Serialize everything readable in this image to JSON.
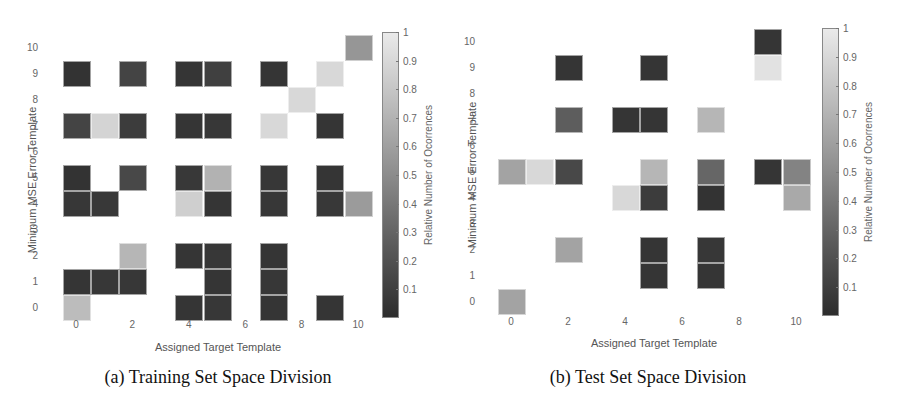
{
  "figure": {
    "captions": [
      "(a) Training Set Space Division",
      "(b) Test Set Space Division"
    ]
  },
  "colors": {
    "background": "#ffffff",
    "colormap": "gray",
    "cell_low": "#2d2d2d",
    "cell_high": "#eaeaea"
  },
  "chart_data": [
    {
      "type": "heatmap",
      "title": "(a) Training Set Space Division",
      "xlabel": "Assigned Target Template",
      "ylabel": "Minimum MSE Error Template",
      "colorbar_label": "Relative Number of Ocorrences",
      "colorbar_ticks": [
        "0.1",
        "0.2",
        "0.3",
        "0.4",
        "0.5",
        "0.6",
        "0.7",
        "0.8",
        "0.9",
        "1"
      ],
      "clim": [
        0,
        1
      ],
      "x_ticks": [
        "0",
        "2",
        "4",
        "6",
        "8",
        "10"
      ],
      "y_ticks": [
        "0",
        "1",
        "2",
        "3",
        "4",
        "5",
        "6",
        "7",
        "8",
        "9",
        "10"
      ],
      "x_range": [
        0,
        10
      ],
      "y_range": [
        0,
        10
      ],
      "cells": [
        {
          "x": 10,
          "y": 10,
          "v": 0.55
        },
        {
          "x": 0,
          "y": 9,
          "v": 0.03
        },
        {
          "x": 2,
          "y": 9,
          "v": 0.12
        },
        {
          "x": 4,
          "y": 9,
          "v": 0.04
        },
        {
          "x": 5,
          "y": 9,
          "v": 0.1
        },
        {
          "x": 7,
          "y": 9,
          "v": 0.04
        },
        {
          "x": 9,
          "y": 9,
          "v": 0.9
        },
        {
          "x": 8,
          "y": 8,
          "v": 0.9
        },
        {
          "x": 0,
          "y": 7,
          "v": 0.12
        },
        {
          "x": 1,
          "y": 7,
          "v": 0.88
        },
        {
          "x": 2,
          "y": 7,
          "v": 0.08
        },
        {
          "x": 4,
          "y": 7,
          "v": 0.04
        },
        {
          "x": 5,
          "y": 7,
          "v": 0.05
        },
        {
          "x": 7,
          "y": 7,
          "v": 0.9
        },
        {
          "x": 9,
          "y": 7,
          "v": 0.04
        },
        {
          "x": 0,
          "y": 5,
          "v": 0.03
        },
        {
          "x": 2,
          "y": 5,
          "v": 0.14
        },
        {
          "x": 4,
          "y": 5,
          "v": 0.06
        },
        {
          "x": 5,
          "y": 5,
          "v": 0.7
        },
        {
          "x": 7,
          "y": 5,
          "v": 0.05
        },
        {
          "x": 9,
          "y": 5,
          "v": 0.04
        },
        {
          "x": 0,
          "y": 4,
          "v": 0.05
        },
        {
          "x": 1,
          "y": 4,
          "v": 0.06
        },
        {
          "x": 4,
          "y": 4,
          "v": 0.85
        },
        {
          "x": 5,
          "y": 4,
          "v": 0.04
        },
        {
          "x": 7,
          "y": 4,
          "v": 0.05
        },
        {
          "x": 9,
          "y": 4,
          "v": 0.06
        },
        {
          "x": 10,
          "y": 4,
          "v": 0.58
        },
        {
          "x": 2,
          "y": 2,
          "v": 0.72
        },
        {
          "x": 4,
          "y": 2,
          "v": 0.04
        },
        {
          "x": 5,
          "y": 2,
          "v": 0.05
        },
        {
          "x": 7,
          "y": 2,
          "v": 0.04
        },
        {
          "x": 0,
          "y": 1,
          "v": 0.04
        },
        {
          "x": 1,
          "y": 1,
          "v": 0.05
        },
        {
          "x": 2,
          "y": 1,
          "v": 0.05
        },
        {
          "x": 5,
          "y": 1,
          "v": 0.04
        },
        {
          "x": 7,
          "y": 1,
          "v": 0.05
        },
        {
          "x": 0,
          "y": 0,
          "v": 0.75
        },
        {
          "x": 4,
          "y": 0,
          "v": 0.04
        },
        {
          "x": 5,
          "y": 0,
          "v": 0.05
        },
        {
          "x": 7,
          "y": 0,
          "v": 0.04
        },
        {
          "x": 9,
          "y": 0,
          "v": 0.04
        }
      ]
    },
    {
      "type": "heatmap",
      "title": "(b) Test Set Space Division",
      "xlabel": "Assigned Target Template",
      "ylabel": "Minimum MSE Error Template",
      "colorbar_label": "Relative Number of Ocorrences",
      "colorbar_ticks": [
        "0.1",
        "0.2",
        "0.3",
        "0.4",
        "0.5",
        "0.6",
        "0.7",
        "0.8",
        "0.9",
        "1"
      ],
      "clim": [
        0,
        1
      ],
      "x_ticks": [
        "0",
        "2",
        "4",
        "6",
        "8",
        "10"
      ],
      "y_ticks": [
        "0",
        "1",
        "2",
        "3",
        "4",
        "5",
        "6",
        "7",
        "8",
        "9",
        "10"
      ],
      "x_range": [
        0,
        10
      ],
      "y_range": [
        0,
        10
      ],
      "cells": [
        {
          "x": 9,
          "y": 10,
          "v": 0.04
        },
        {
          "x": 2,
          "y": 9,
          "v": 0.04
        },
        {
          "x": 5,
          "y": 9,
          "v": 0.04
        },
        {
          "x": 9,
          "y": 9,
          "v": 0.95
        },
        {
          "x": 2,
          "y": 7,
          "v": 0.25
        },
        {
          "x": 4,
          "y": 7,
          "v": 0.04
        },
        {
          "x": 5,
          "y": 7,
          "v": 0.04
        },
        {
          "x": 7,
          "y": 7,
          "v": 0.72
        },
        {
          "x": 0,
          "y": 5,
          "v": 0.62
        },
        {
          "x": 1,
          "y": 5,
          "v": 0.9
        },
        {
          "x": 2,
          "y": 5,
          "v": 0.14
        },
        {
          "x": 5,
          "y": 5,
          "v": 0.72
        },
        {
          "x": 7,
          "y": 5,
          "v": 0.3
        },
        {
          "x": 9,
          "y": 5,
          "v": 0.04
        },
        {
          "x": 10,
          "y": 5,
          "v": 0.45
        },
        {
          "x": 4,
          "y": 4,
          "v": 0.9
        },
        {
          "x": 5,
          "y": 4,
          "v": 0.08
        },
        {
          "x": 7,
          "y": 4,
          "v": 0.03
        },
        {
          "x": 10,
          "y": 4,
          "v": 0.65
        },
        {
          "x": 2,
          "y": 2,
          "v": 0.62
        },
        {
          "x": 5,
          "y": 2,
          "v": 0.04
        },
        {
          "x": 7,
          "y": 2,
          "v": 0.05
        },
        {
          "x": 5,
          "y": 1,
          "v": 0.04
        },
        {
          "x": 7,
          "y": 1,
          "v": 0.04
        },
        {
          "x": 0,
          "y": 0,
          "v": 0.62
        }
      ]
    }
  ]
}
